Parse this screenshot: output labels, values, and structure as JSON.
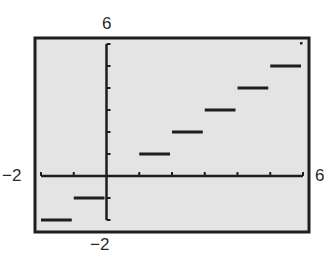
{
  "chart_data": {
    "type": "line",
    "title": "",
    "function": "y = greatest integer of x (step function)",
    "xlabel": "",
    "ylabel": "",
    "xlim": [
      -2,
      6
    ],
    "ylim": [
      -2,
      6
    ],
    "xscl": 1,
    "yscl": 1,
    "grid": false,
    "window_labels": {
      "ymax": "6",
      "ymin": "−2",
      "xmin": "−2",
      "xmax": "6"
    },
    "segments": [
      {
        "x_start": -2,
        "x_end": -1,
        "y": -2
      },
      {
        "x_start": -1,
        "x_end": 0,
        "y": -1
      },
      {
        "x_start": 0,
        "x_end": 1,
        "y": 0
      },
      {
        "x_start": 1,
        "x_end": 2,
        "y": 1
      },
      {
        "x_start": 2,
        "x_end": 3,
        "y": 2
      },
      {
        "x_start": 3,
        "x_end": 4,
        "y": 3
      },
      {
        "x_start": 4,
        "x_end": 5,
        "y": 4
      },
      {
        "x_start": 5,
        "x_end": 6,
        "y": 5
      }
    ]
  },
  "colors": {
    "screen_bg": "#e4e4e4",
    "ink": "#1e1e1e",
    "frame": "#1e1e1e"
  }
}
